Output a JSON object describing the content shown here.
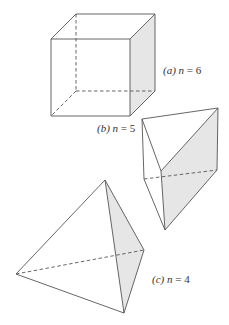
{
  "figure": {
    "panels": [
      {
        "id": "a",
        "shape": "cube",
        "label_prefix": "(a)",
        "label_var": "n",
        "label_eq": "=",
        "label_value": "6"
      },
      {
        "id": "b",
        "shape": "triangular prism",
        "label_prefix": "(b)",
        "label_var": "n",
        "label_eq": "=",
        "label_value": "5"
      },
      {
        "id": "c",
        "shape": "tetrahedron",
        "label_prefix": "(c)",
        "label_var": "n",
        "label_eq": "=",
        "label_value": "4"
      }
    ],
    "colors": {
      "edge": "#555555",
      "shaded_face": "#e6e6e6",
      "background": "#ffffff"
    }
  }
}
